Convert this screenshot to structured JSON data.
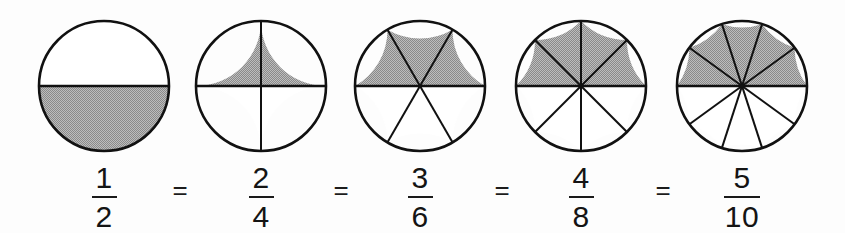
{
  "figure": {
    "background_color": "#fdfdfd",
    "outline_color": "#111111",
    "shade_color": "#a3a3a3",
    "unshaded_color": "#ffffff"
  },
  "chart_data": {
    "type": "pie",
    "title": "",
    "subtitle": "",
    "xlabel": "",
    "ylabel": "",
    "legend": [],
    "grid": false,
    "note": "Five circle (pie) area models, each divided into equal sectors with the top half shaded, illustrating equivalent fractions.",
    "models": [
      {
        "index": 1,
        "total_sectors": 2,
        "shaded_sectors": 1,
        "fraction_numerator": "1",
        "fraction_denominator": "2",
        "fraction_text": "1/2",
        "value": 0.5,
        "center_x": 104,
        "center_y": 86,
        "radius": 65,
        "sector_angle_deg": 180
      },
      {
        "index": 2,
        "total_sectors": 4,
        "shaded_sectors": 2,
        "fraction_numerator": "2",
        "fraction_denominator": "4",
        "fraction_text": "2/4",
        "value": 0.5,
        "center_x": 261,
        "center_y": 86,
        "radius": 65,
        "sector_angle_deg": 90
      },
      {
        "index": 3,
        "total_sectors": 6,
        "shaded_sectors": 3,
        "fraction_numerator": "3",
        "fraction_denominator": "6",
        "fraction_text": "3/6",
        "value": 0.5,
        "center_x": 420,
        "center_y": 86,
        "radius": 65,
        "sector_angle_deg": 60
      },
      {
        "index": 4,
        "total_sectors": 8,
        "shaded_sectors": 4,
        "fraction_numerator": "4",
        "fraction_denominator": "8",
        "fraction_text": "4/8",
        "value": 0.5,
        "center_x": 581,
        "center_y": 86,
        "radius": 65,
        "sector_angle_deg": 45
      },
      {
        "index": 5,
        "total_sectors": 10,
        "shaded_sectors": 5,
        "fraction_numerator": "5",
        "fraction_denominator": "10",
        "fraction_text": "5/10",
        "value": 0.5,
        "center_x": 742,
        "center_y": 86,
        "radius": 65,
        "sector_angle_deg": 36
      }
    ],
    "equals_signs": [
      {
        "index": 1,
        "label": "=",
        "x": 180,
        "y": 190
      },
      {
        "index": 2,
        "label": "=",
        "x": 341,
        "y": 190
      },
      {
        "index": 3,
        "label": "=",
        "x": 502,
        "y": 190
      },
      {
        "index": 4,
        "label": "=",
        "x": 663,
        "y": 190
      }
    ]
  }
}
